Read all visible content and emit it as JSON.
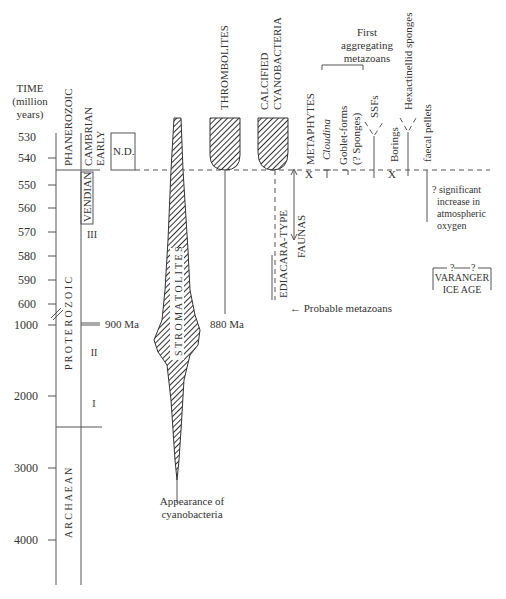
{
  "axis": {
    "title_line1": "TIME",
    "title_line2": "(million",
    "title_line3": "years)",
    "ticks": [
      "530",
      "540",
      "550",
      "560",
      "570",
      "580",
      "590",
      "600",
      "1000",
      "2000",
      "3000",
      "4000"
    ]
  },
  "eons": {
    "phanerozoic": "PHANEROZOIC",
    "proterozoic": "P R O T E R O Z O I C",
    "archaean": "A R C H A E A N"
  },
  "periods": {
    "cambrian": "CAMBRIAN",
    "early": "EARLY",
    "vendian": "VENDIAN",
    "nd": "N.D.",
    "roman3": "III",
    "roman2": "II",
    "roman1": "I",
    "ma900": "900 Ma"
  },
  "taxa": {
    "stromatolites": "S T R O M A T O L I T E S",
    "thrombolites": "THROMBOLITES",
    "calcified_line1": "CALCIFIED",
    "calcified_line2": "CYANOBACTERIA",
    "ma880": "880 Ma",
    "metaphytes": "METAPHYTES",
    "cloudina": "Cloudina",
    "goblet_line1": "Goblet-forms",
    "goblet_line2": "(? Sponges)",
    "ssfs": "SSFs",
    "borings": "Borings",
    "hexactinellid": "Hexactinellid sponges",
    "faecal": "faecal pellets",
    "ediacara": "EDIACARA-TYPE",
    "faunas": "FAUNAS",
    "probable": "← Probable metazoans",
    "first_line1": "First",
    "first_line2": "aggregating",
    "first_line3": "metazoans",
    "cyano_line1": "Appearance of",
    "cyano_line2": "cyanobacteria",
    "oxygen_line1": "? significant",
    "oxygen_line2": "increase in",
    "oxygen_line3": "atmospheric",
    "oxygen_line4": "oxygen",
    "varanger_q": "? —? ",
    "varanger_line1": "VARANGER",
    "varanger_line2": "ICE AGE",
    "x_mark": "X"
  }
}
